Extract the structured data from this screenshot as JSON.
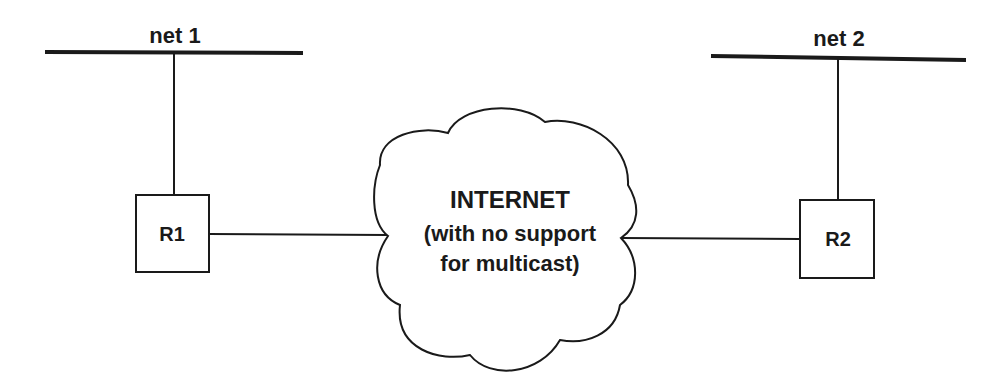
{
  "diagram": {
    "colors": {
      "stroke": "#1a1a1a",
      "background": "#ffffff"
    },
    "networks": [
      {
        "id": "net1",
        "label": "net 1"
      },
      {
        "id": "net2",
        "label": "net 2"
      }
    ],
    "routers": [
      {
        "id": "R1",
        "label": "R1"
      },
      {
        "id": "R2",
        "label": "R2"
      }
    ],
    "cloud": {
      "title": "INTERNET",
      "subtitle_line1": "(with no support",
      "subtitle_line2": "for multicast)"
    },
    "links": [
      {
        "from": "net 1",
        "to": "R1"
      },
      {
        "from": "R1",
        "to": "INTERNET"
      },
      {
        "from": "INTERNET",
        "to": "R2"
      },
      {
        "from": "R2",
        "to": "net 2"
      }
    ]
  }
}
